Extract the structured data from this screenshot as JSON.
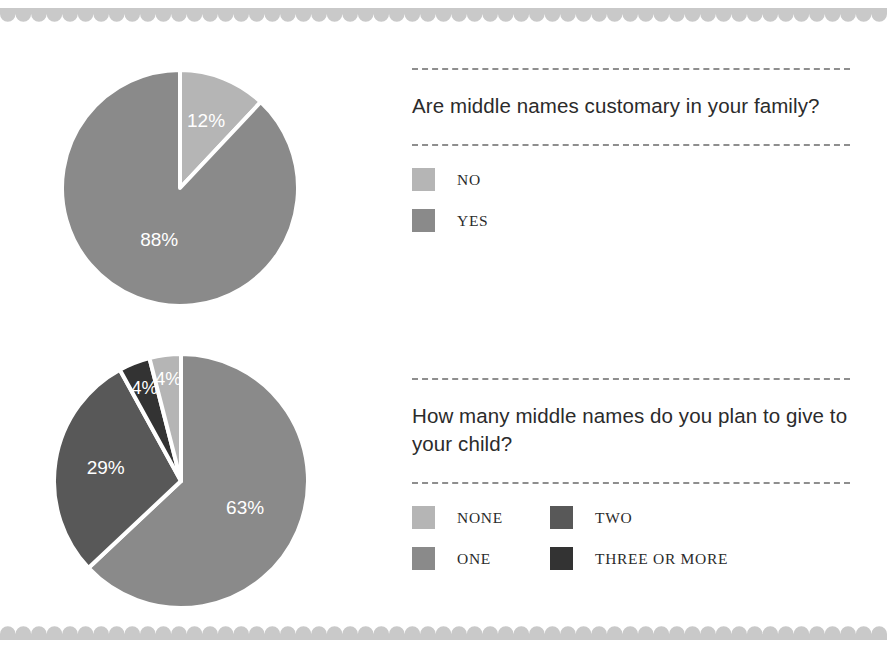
{
  "page": {
    "background": "#ffffff",
    "border_color": "#c9c9c9",
    "text_color": "#2b2b2b",
    "divider_color": "#8e8e8e"
  },
  "decoration": {
    "top_scallop_name": "scalloped-border-top",
    "bottom_scallop_name": "scalloped-border-bottom",
    "scallop_count": 57,
    "scallop_color": "#c9c9c9"
  },
  "palette": {
    "none": "#b5b5b5",
    "one": "#8a8a8a",
    "two": "#585858",
    "three_or_more": "#333333",
    "no": "#b5b5b5",
    "yes": "#8a8a8a",
    "slice_gap": "#ffffff",
    "label_text": "#ffffff"
  },
  "sections": [
    {
      "id": "middle-names-customary",
      "question": "Are middle names customary in your family?",
      "legend": [
        {
          "label": "NO",
          "color": "#b5b5b5"
        },
        {
          "label": "YES",
          "color": "#8a8a8a"
        }
      ]
    },
    {
      "id": "how-many-middle-names",
      "question": "How many middle names do you plan to give to your child?",
      "legend": [
        {
          "label": "NONE",
          "color": "#b5b5b5"
        },
        {
          "label": "TWO",
          "color": "#585858"
        },
        {
          "label": "ONE",
          "color": "#8a8a8a"
        },
        {
          "label": "THREE OR MORE",
          "color": "#333333"
        }
      ]
    }
  ],
  "chart_data": [
    {
      "type": "pie",
      "title": "Are middle names customary in your family?",
      "categories": [
        "NO",
        "YES"
      ],
      "values": [
        12,
        88
      ],
      "labels": [
        "12%",
        "88%"
      ],
      "colors": [
        "#b5b5b5",
        "#8a8a8a"
      ],
      "unit": "percent",
      "start_angle_deg": 0,
      "direction": "clockwise",
      "legend_position": "right",
      "grid": false
    },
    {
      "type": "pie",
      "title": "How many middle names do you plan to give to your child?",
      "categories": [
        "ONE",
        "TWO",
        "THREE OR MORE",
        "NONE"
      ],
      "values": [
        63,
        29,
        4,
        4
      ],
      "labels": [
        "63%",
        "29%",
        "4%",
        "4%"
      ],
      "colors": [
        "#8a8a8a",
        "#585858",
        "#333333",
        "#b5b5b5"
      ],
      "unit": "percent",
      "start_angle_deg": 0,
      "direction": "clockwise",
      "legend_position": "right",
      "grid": false
    }
  ]
}
